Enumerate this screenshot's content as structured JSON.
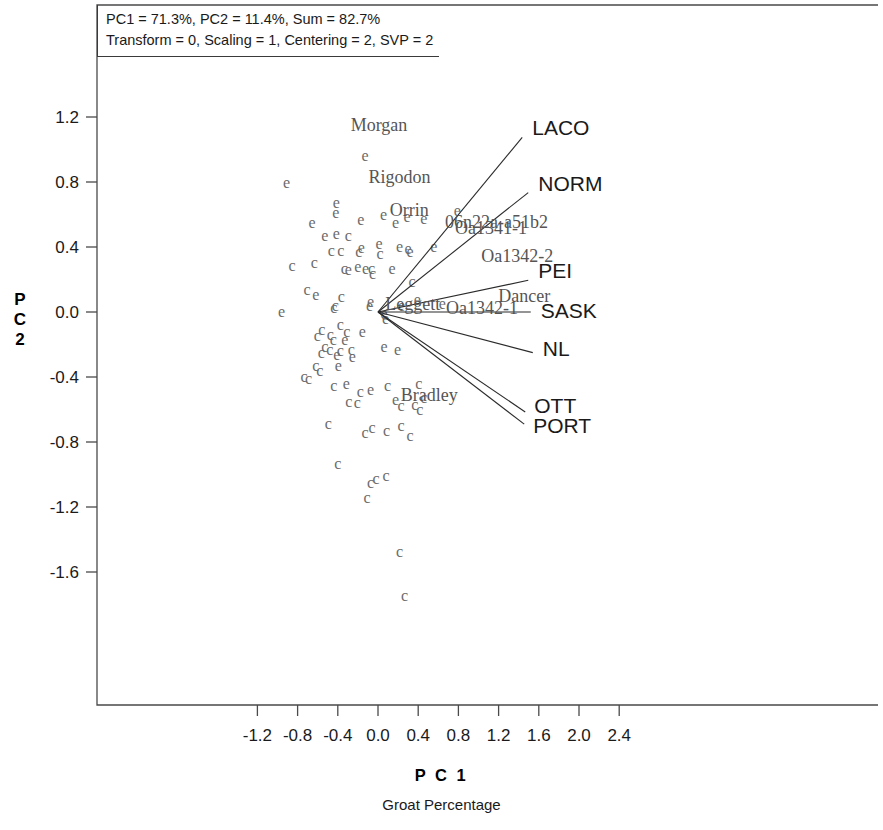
{
  "annotation": {
    "line1": "PC1 = 71.3%, PC2 = 11.4%, Sum = 82.7%",
    "line2": "Transform = 0, Scaling = 1, Centering = 2, SVP = 2"
  },
  "axes": {
    "x_title": "P C 1",
    "x_subtitle": "Groat Percentage",
    "y_title_chars": [
      "P",
      "C",
      "2"
    ]
  },
  "chart_data": {
    "type": "scatter",
    "title": "",
    "subtitle": "Groat Percentage",
    "xlabel": "P C 1",
    "ylabel": "P C 2",
    "xlim": [
      -1.45,
      2.55
    ],
    "ylim": [
      -1.95,
      1.42
    ],
    "grid": false,
    "legend": "none",
    "variance_explained": {
      "PC1": 71.3,
      "PC2": 11.4,
      "sum": 82.7
    },
    "parameters": {
      "Transform": 0,
      "Scaling": 1,
      "Centering": 2,
      "SVP": 2
    },
    "xticks": [
      -1.2,
      -0.8,
      -0.4,
      0.0,
      0.4,
      0.8,
      1.2,
      1.6,
      2.0,
      2.4
    ],
    "xticklabels": [
      "-1.2",
      "-0.8",
      "-0.4",
      "0.0",
      "0.4",
      "0.8",
      "1.2",
      "1.6",
      "2.0",
      "2.4"
    ],
    "yticks": [
      1.2,
      0.8,
      0.4,
      0.0,
      -0.4,
      -0.8,
      -1.2,
      -1.6
    ],
    "yticklabels": [
      "1.2",
      "0.8",
      "0.4",
      "0.0",
      "-0.4",
      "-0.8",
      "-1.2",
      "-1.6"
    ],
    "origin": [
      0.0,
      0.0
    ],
    "point_color": "#6b6b6b",
    "vector_color": "#2b2b2b",
    "env_vectors": [
      {
        "label": "LACO",
        "x": 1.435,
        "y": 1.075,
        "label_dx": 10,
        "label_dy": -2
      },
      {
        "label": "NORM",
        "x": 1.495,
        "y": 0.735,
        "label_dx": 10,
        "label_dy": -2
      },
      {
        "label": "PEI",
        "x": 1.495,
        "y": 0.195,
        "label_dx": 10,
        "label_dy": -2
      },
      {
        "label": "SASK",
        "x": 1.52,
        "y": 0.0,
        "label_dx": 10,
        "label_dy": 6
      },
      {
        "label": "NL",
        "x": 1.54,
        "y": -0.25,
        "label_dx": 10,
        "label_dy": 3
      },
      {
        "label": "OTT",
        "x": 1.465,
        "y": -0.615,
        "label_dx": 9,
        "label_dy": 1
      },
      {
        "label": "PORT",
        "x": 1.455,
        "y": -0.69,
        "label_dx": 9,
        "label_dy": 9
      }
    ],
    "genotype_labels": [
      {
        "text": "Morgan",
        "x": 0.01,
        "y": 1.115
      },
      {
        "text": "Rigodon",
        "x": 0.215,
        "y": 0.795
      },
      {
        "text": "Orrin",
        "x": 0.31,
        "y": 0.59
      },
      {
        "text": "Leggett",
        "x": 0.345,
        "y": 0.01
      },
      {
        "text": "Bradley",
        "x": 0.51,
        "y": -0.545
      },
      {
        "text": "Dancer",
        "x": 1.455,
        "y": 0.06
      },
      {
        "text": "06n22a-a51b2",
        "x": 1.18,
        "y": 0.52
      },
      {
        "text": "Oa1341-1",
        "x": 1.125,
        "y": 0.48
      },
      {
        "text": "Oa1342-2",
        "x": 1.385,
        "y": 0.31
      },
      {
        "text": "Oa1342-1",
        "x": 1.035,
        "y": -0.015
      }
    ],
    "points": [
      {
        "m": "e",
        "x": -0.91,
        "y": 0.795
      },
      {
        "m": "e",
        "x": -0.13,
        "y": 0.96
      },
      {
        "m": "e",
        "x": -0.415,
        "y": 0.67
      },
      {
        "m": "e",
        "x": -0.42,
        "y": 0.61
      },
      {
        "m": "e",
        "x": -0.655,
        "y": 0.545
      },
      {
        "m": "e",
        "x": -0.17,
        "y": 0.565
      },
      {
        "m": "e",
        "x": 0.055,
        "y": 0.6
      },
      {
        "m": "e",
        "x": 0.29,
        "y": 0.585
      },
      {
        "m": "e",
        "x": 0.79,
        "y": 0.62
      },
      {
        "m": "e",
        "x": 0.175,
        "y": 0.545
      },
      {
        "m": "e",
        "x": 0.455,
        "y": 0.575
      },
      {
        "m": "e",
        "x": -0.415,
        "y": 0.48
      },
      {
        "m": "c",
        "x": -0.295,
        "y": 0.465
      },
      {
        "m": "e",
        "x": -0.53,
        "y": 0.47
      },
      {
        "m": "e",
        "x": 0.01,
        "y": 0.42
      },
      {
        "m": "e",
        "x": -0.165,
        "y": 0.395
      },
      {
        "m": "c",
        "x": -0.465,
        "y": 0.375
      },
      {
        "m": "c",
        "x": -0.37,
        "y": 0.375
      },
      {
        "m": "c",
        "x": -0.19,
        "y": 0.37
      },
      {
        "m": "c",
        "x": 0.02,
        "y": 0.36
      },
      {
        "m": "e",
        "x": 0.215,
        "y": 0.4
      },
      {
        "m": "e",
        "x": 0.3,
        "y": 0.385
      },
      {
        "m": "e",
        "x": 0.32,
        "y": 0.37
      },
      {
        "m": "e",
        "x": 0.555,
        "y": 0.4
      },
      {
        "m": "c",
        "x": -0.855,
        "y": 0.285
      },
      {
        "m": "c",
        "x": -0.635,
        "y": 0.3
      },
      {
        "m": "c",
        "x": -0.335,
        "y": 0.265
      },
      {
        "m": "e",
        "x": -0.295,
        "y": 0.26
      },
      {
        "m": "e",
        "x": -0.2,
        "y": 0.275
      },
      {
        "m": "e",
        "x": -0.125,
        "y": 0.265
      },
      {
        "m": "c",
        "x": -0.065,
        "y": 0.262
      },
      {
        "m": "c",
        "x": -0.055,
        "y": 0.235
      },
      {
        "m": "e",
        "x": 0.14,
        "y": 0.265
      },
      {
        "m": "c",
        "x": -0.705,
        "y": 0.135
      },
      {
        "m": "e",
        "x": -0.62,
        "y": 0.105
      },
      {
        "m": "c",
        "x": -0.365,
        "y": 0.09
      },
      {
        "m": "c",
        "x": -0.425,
        "y": 0.04
      },
      {
        "m": "c",
        "x": -0.44,
        "y": 0.025
      },
      {
        "m": "e",
        "x": -0.075,
        "y": 0.06
      },
      {
        "m": "e",
        "x": -0.085,
        "y": 0.035
      },
      {
        "m": "e",
        "x": -0.96,
        "y": 0.0
      },
      {
        "m": "e",
        "x": 0.06,
        "y": -0.01
      },
      {
        "m": "e",
        "x": 0.075,
        "y": -0.04
      },
      {
        "m": "e",
        "x": 0.235,
        "y": 0.035
      },
      {
        "m": "e",
        "x": 0.39,
        "y": 0.075
      },
      {
        "m": "c",
        "x": 0.34,
        "y": 0.185
      },
      {
        "m": "e",
        "x": 0.64,
        "y": 0.05
      },
      {
        "m": "c",
        "x": -0.375,
        "y": -0.08
      },
      {
        "m": "c",
        "x": -0.56,
        "y": -0.11
      },
      {
        "m": "c",
        "x": -0.605,
        "y": -0.15
      },
      {
        "m": "c",
        "x": -0.475,
        "y": -0.14
      },
      {
        "m": "c",
        "x": -0.445,
        "y": -0.175
      },
      {
        "m": "c",
        "x": -0.31,
        "y": -0.125
      },
      {
        "m": "e",
        "x": -0.33,
        "y": -0.17
      },
      {
        "m": "e",
        "x": -0.155,
        "y": -0.12
      },
      {
        "m": "c",
        "x": -0.53,
        "y": -0.215
      },
      {
        "m": "c",
        "x": -0.48,
        "y": -0.235
      },
      {
        "m": "c",
        "x": -0.565,
        "y": -0.25
      },
      {
        "m": "c",
        "x": -0.375,
        "y": -0.24
      },
      {
        "m": "e",
        "x": -0.41,
        "y": -0.265
      },
      {
        "m": "c",
        "x": -0.265,
        "y": -0.235
      },
      {
        "m": "e",
        "x": -0.255,
        "y": -0.275
      },
      {
        "m": "e",
        "x": 0.06,
        "y": -0.215
      },
      {
        "m": "e",
        "x": 0.195,
        "y": -0.235
      },
      {
        "m": "c",
        "x": -0.62,
        "y": -0.33
      },
      {
        "m": "c",
        "x": -0.58,
        "y": -0.36
      },
      {
        "m": "e",
        "x": -0.395,
        "y": -0.33
      },
      {
        "m": "c",
        "x": -0.735,
        "y": -0.4
      },
      {
        "m": "c",
        "x": -0.69,
        "y": -0.415
      },
      {
        "m": "c",
        "x": -0.44,
        "y": -0.455
      },
      {
        "m": "e",
        "x": -0.315,
        "y": -0.44
      },
      {
        "m": "c",
        "x": -0.175,
        "y": -0.49
      },
      {
        "m": "e",
        "x": -0.075,
        "y": -0.48
      },
      {
        "m": "c",
        "x": 0.095,
        "y": -0.455
      },
      {
        "m": "c",
        "x": 0.405,
        "y": -0.44
      },
      {
        "m": "c",
        "x": 0.455,
        "y": -0.53
      },
      {
        "m": "e",
        "x": 0.175,
        "y": -0.54
      },
      {
        "m": "c",
        "x": -0.205,
        "y": -0.56
      },
      {
        "m": "c",
        "x": -0.29,
        "y": -0.555
      },
      {
        "m": "c",
        "x": 0.23,
        "y": -0.58
      },
      {
        "m": "c",
        "x": 0.365,
        "y": -0.57
      },
      {
        "m": "c",
        "x": 0.415,
        "y": -0.605
      },
      {
        "m": "c",
        "x": -0.495,
        "y": -0.69
      },
      {
        "m": "c",
        "x": -0.13,
        "y": -0.745
      },
      {
        "m": "c",
        "x": -0.06,
        "y": -0.715
      },
      {
        "m": "c",
        "x": 0.085,
        "y": -0.735
      },
      {
        "m": "c",
        "x": 0.23,
        "y": -0.7
      },
      {
        "m": "c",
        "x": 0.32,
        "y": -0.76
      },
      {
        "m": "c",
        "x": -0.4,
        "y": -0.935
      },
      {
        "m": "c",
        "x": -0.075,
        "y": -1.055
      },
      {
        "m": "c",
        "x": -0.02,
        "y": -1.03
      },
      {
        "m": "c",
        "x": 0.08,
        "y": -1.01
      },
      {
        "m": "c",
        "x": -0.11,
        "y": -1.145
      },
      {
        "m": "c",
        "x": 0.215,
        "y": -1.475
      },
      {
        "m": "c",
        "x": 0.265,
        "y": -1.745
      }
    ]
  }
}
